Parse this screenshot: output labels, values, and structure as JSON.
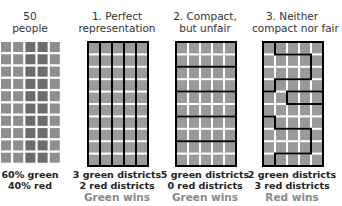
{
  "colors": {
    "green_cell": "#8e8e8e",
    "red_cell": "#6c6c6c",
    "district_cell": "#9a9a9a",
    "border": "#000000",
    "verdict_text": "#8a8a8a"
  },
  "panels": [
    {
      "title_line1": "50",
      "title_line2": "people",
      "stats_line1": "60% green",
      "stats_line2": "40% red",
      "verdict": ""
    },
    {
      "title_line1": "1. Perfect",
      "title_line2": "representation",
      "stats_line1": "3 green districts",
      "stats_line2": "2 red districts",
      "verdict": "Green wins"
    },
    {
      "title_line1": "2. Compact,",
      "title_line2": "but unfair",
      "stats_line1": "5 green districts",
      "stats_line2": "0 red districts",
      "verdict": "Green wins"
    },
    {
      "title_line1": "3. Neither",
      "title_line2": "compact nor fair",
      "stats_line1": "2 green districts",
      "stats_line2": "3 red districts",
      "verdict": "Red wins"
    }
  ]
}
